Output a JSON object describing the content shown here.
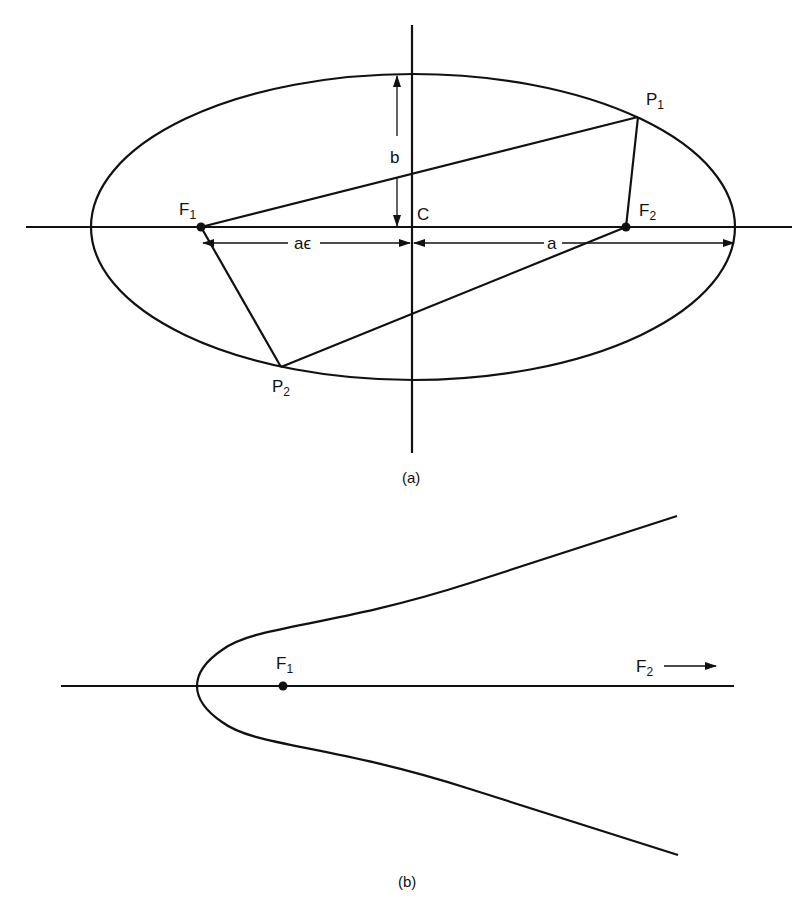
{
  "figure_a": {
    "caption": "(a)",
    "center_label": "C",
    "focus1": {
      "main": "F",
      "sub": "1"
    },
    "focus2": {
      "main": "F",
      "sub": "2"
    },
    "point1": {
      "main": "P",
      "sub": "1"
    },
    "point2": {
      "main": "P",
      "sub": "2"
    },
    "semi_minor_label": "b",
    "focal_distance_label": "aϵ",
    "semi_major_label": "a"
  },
  "figure_b": {
    "caption": "(b)",
    "focus1": {
      "main": "F",
      "sub": "1"
    },
    "focus2": {
      "main": "F",
      "sub": "2"
    },
    "focus2_arrow": "→"
  },
  "colors": {
    "ink": "#111111",
    "background": "#ffffff"
  }
}
